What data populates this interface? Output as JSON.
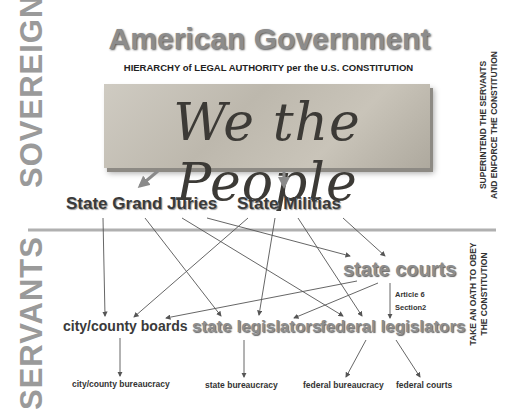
{
  "title": "American Government",
  "subtitle": "HIERARCHY of LEGAL AUTHORITY per the U.S. CONSTITUTION",
  "image_text": "We the People",
  "left_labels": {
    "sovereign": "SOVEREIGN",
    "servants": "SERVANTS"
  },
  "right_labels": {
    "sovereign_line1": "SUPERINTEND THE SERVANTS",
    "sovereign_line2": "AND ENFORCE THE CONSTITUTION",
    "servants_line1": "TAKE AN OATH TO OBEY",
    "servants_line2": "THE CONSTITUTION"
  },
  "nodes": {
    "grand_juries": "State Grand Juries",
    "militias": "State Militias",
    "state_courts": "state courts",
    "article_line1": "Article 6",
    "article_line2": "Section2",
    "city_county_boards": "city/county boards",
    "state_legislators": "state legislators",
    "federal_legislators": "federal legislators",
    "city_county_bureaucracy": "city/county bureaucracy",
    "state_bureaucracy": "state bureaucracy",
    "federal_bureaucracy": "federal bureaucracy",
    "federal_courts": "federal courts"
  },
  "colors": {
    "gray_text": "#8d8d8d",
    "dark_text": "#3a3a3a",
    "divider": "#b0b0b0",
    "arrow_big": "#8a8a8a",
    "line": "#555555"
  }
}
